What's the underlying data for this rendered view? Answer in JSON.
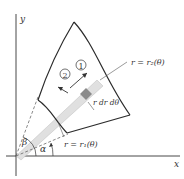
{
  "figure": {
    "axes": {
      "x_label": "x",
      "y_label": "y"
    },
    "curves": {
      "outer_label": "r = r₂(θ)",
      "inner_label": "r = r₁(θ)"
    },
    "angles": {
      "alpha": "α",
      "beta": "β"
    },
    "element_label": "r dr dθ",
    "steps": {
      "step1": "1",
      "step2": "2"
    },
    "colors": {
      "line": "#2b2b2b",
      "strip": "#d9d9d9",
      "element": "#8a8a8a",
      "dashed": "#555555"
    }
  }
}
